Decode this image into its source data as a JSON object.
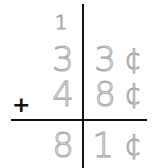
{
  "worksheet": {
    "operator": "+",
    "carry": "1",
    "rows": [
      {
        "tens": "3",
        "ones": "3",
        "unit": "¢"
      },
      {
        "tens": "4",
        "ones": "8",
        "unit": "¢"
      }
    ],
    "result": {
      "tens": "8",
      "ones": "1",
      "unit": "¢"
    }
  }
}
